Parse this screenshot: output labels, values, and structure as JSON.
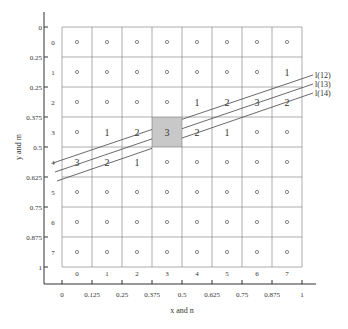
{
  "figure": {
    "xlabel": "x and n",
    "ylabel": "y and m",
    "x_ticks": [
      "0",
      "0.125",
      "0.25",
      "0.375",
      "0.5",
      "0.625",
      "0.75",
      "0.875",
      "1"
    ],
    "y_ticks": [
      "0",
      "0.25",
      "0.25",
      "0.375",
      "0.5",
      "0.625",
      "0.75",
      "0.875",
      "1"
    ],
    "col_indices": [
      "0",
      "1",
      "2",
      "3",
      "4",
      "5",
      "6",
      "7"
    ],
    "row_indices": [
      "0",
      "1",
      "2",
      "3",
      "4",
      "5",
      "6",
      "7"
    ],
    "grid": [
      [
        "o",
        "o",
        "o",
        "o",
        "o",
        "o",
        "o",
        "o"
      ],
      [
        "o",
        "o",
        "o",
        "o",
        "o",
        "o",
        "o",
        "1"
      ],
      [
        "o",
        "o",
        "o",
        "o",
        "1",
        "2",
        "3",
        "2"
      ],
      [
        "o",
        "1",
        "2",
        "3",
        "2",
        "1",
        "o",
        "o"
      ],
      [
        "3",
        "2",
        "1",
        "o",
        "o",
        "o",
        "o",
        "o"
      ],
      [
        "o",
        "o",
        "o",
        "o",
        "o",
        "o",
        "o",
        "o"
      ],
      [
        "o",
        "o",
        "o",
        "o",
        "o",
        "o",
        "o",
        "o"
      ],
      [
        "o",
        "o",
        "o",
        "o",
        "o",
        "o",
        "o",
        "o"
      ]
    ],
    "highlighted_cell": {
      "row": 3,
      "col": 3,
      "color": "#c8c8c8"
    },
    "lines": [
      {
        "label": "l(12)",
        "x1": 53,
        "y1": 163,
        "x2": 313,
        "y2": 75
      },
      {
        "label": "l(13)",
        "x1": 55,
        "y1": 172,
        "x2": 313,
        "y2": 84
      },
      {
        "label": "l(14)",
        "x1": 57,
        "y1": 181,
        "x2": 313,
        "y2": 93
      }
    ]
  }
}
